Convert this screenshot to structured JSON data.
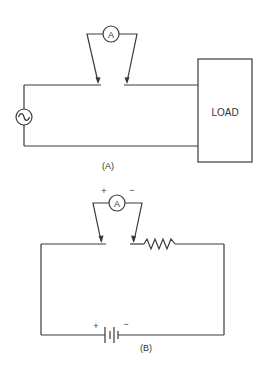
{
  "diagram_a": {
    "caption": "(A)",
    "ammeter_label": "A",
    "load_label": "LOAD",
    "source": "ac-source-icon"
  },
  "diagram_b": {
    "caption": "(B)",
    "ammeter_label": "A",
    "ammeter_plus": "+",
    "ammeter_minus": "−",
    "battery_plus": "+",
    "battery_minus": "−",
    "source": "battery-icon",
    "load": "resistor-icon"
  },
  "colors": {
    "line": "#3a3a3a",
    "background": "#ffffff"
  }
}
